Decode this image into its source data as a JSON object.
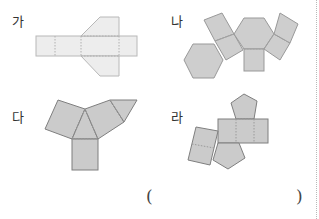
{
  "problem": {
    "options": [
      {
        "id": "ga",
        "label": "가",
        "description": "net with rectangles and two trapezoids (light)"
      },
      {
        "id": "na",
        "label": "나",
        "description": "net with two hexagons and six squares"
      },
      {
        "id": "da",
        "label": "다",
        "description": "net with two triangles and three squares"
      },
      {
        "id": "ra",
        "label": "라",
        "description": "net with two pentagons and five squares"
      }
    ],
    "answer_open_paren": "(",
    "answer_close_paren": ")"
  },
  "colors": {
    "light_fill": "#ededed",
    "light_stroke": "#b8b8b8",
    "dark_fill": "#cdcdcd",
    "dark_stroke": "#8d8d8d",
    "dashed_line": "#a0a0a0",
    "divider": "#b9b9b9"
  }
}
